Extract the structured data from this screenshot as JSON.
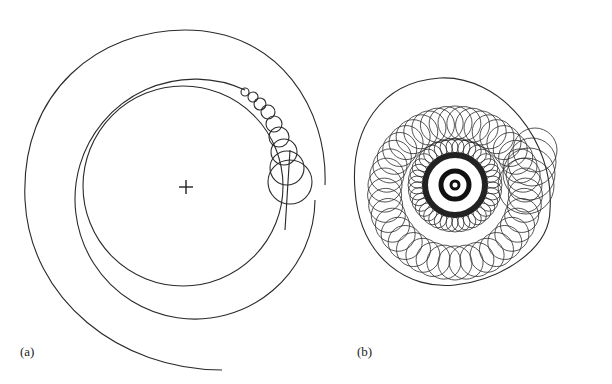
{
  "figure": {
    "panels": [
      {
        "id": "a",
        "label": "(a)",
        "description": "Trajectory spiralling outward around central fixed point (marked with +), with small loops near right side growing into larger circles"
      },
      {
        "id": "b",
        "label": "(b)",
        "description": "Dense spiral of overlapping loops (trochoid-like), tightly wound at center, expanding outward"
      }
    ],
    "center_marker": "+",
    "stroke_color": "#2a2a2a"
  }
}
